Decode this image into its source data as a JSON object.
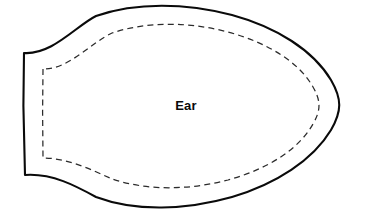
{
  "canvas": {
    "width": 365,
    "height": 220,
    "background_color": "#ffffff"
  },
  "pattern": {
    "title": "Ear",
    "label": "Ear",
    "label_position": {
      "x": 186,
      "y": 107
    },
    "cut_line": {
      "name": "cutting-line",
      "style": "solid",
      "color": "#0a0a0a",
      "stroke_width": 2.1,
      "path": "M 24 53 L 23.4 106 L 25 175 C 52 173 76 186 96 197 C 136 212 186 210 232 197 C 276 184 313 160 331 130 C 342 111 342 99 331 80 C 313 50 276 27 232 15 C 186 3 136 2 96 16 C 76 26 52 55 24 53 Z"
    },
    "seam_line": {
      "name": "seam-allowance-line",
      "style": "dashed",
      "color": "#2b2b2b",
      "stroke_width": 1.25,
      "dash_pattern": "6 4.2",
      "path": "M 43 69 L 42.6 112 L 43 158 C 68 158 92 170 112 179 C 148 191 190 190 228 180 C 268 169 299 149 313 124 C 321 110 321 101 313 87 C 299 62 268 43 228 32 C 190 22 148 21 112 33 C 92 42 68 70 43 69 Z"
    }
  },
  "colors": {
    "outline": "#0a0a0a",
    "seam": "#2b2b2b",
    "fill": "#ffffff",
    "label_text": "#0a0a0a"
  }
}
